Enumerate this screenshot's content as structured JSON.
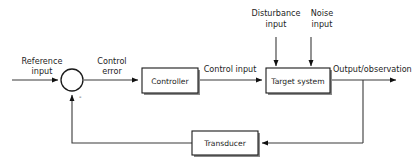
{
  "diagram": {
    "type": "control-system-block-diagram",
    "background_color": "#ffffff",
    "line_color": "#3a3a3a",
    "text_color": "#1d1d1d",
    "block_fill": "#ffffff",
    "block_shadow_color": "#8a8a8a"
  },
  "blocks": {
    "controller": {
      "label": "Controller"
    },
    "target_system": {
      "label": "Target system"
    },
    "transducer": {
      "label": "Transducer"
    },
    "summing_junction": {
      "minus_sign": "-"
    }
  },
  "signals": {
    "reference_input": {
      "line1": "Reference",
      "line2": "input"
    },
    "control_error": {
      "line1": "Control",
      "line2": "error"
    },
    "control_input": {
      "label": "Control input"
    },
    "disturbance_input": {
      "line1": "Disturbance",
      "line2": "input"
    },
    "noise_input": {
      "line1": "Noise",
      "line2": "input"
    },
    "output_observation": {
      "label": "Output/observation"
    }
  }
}
